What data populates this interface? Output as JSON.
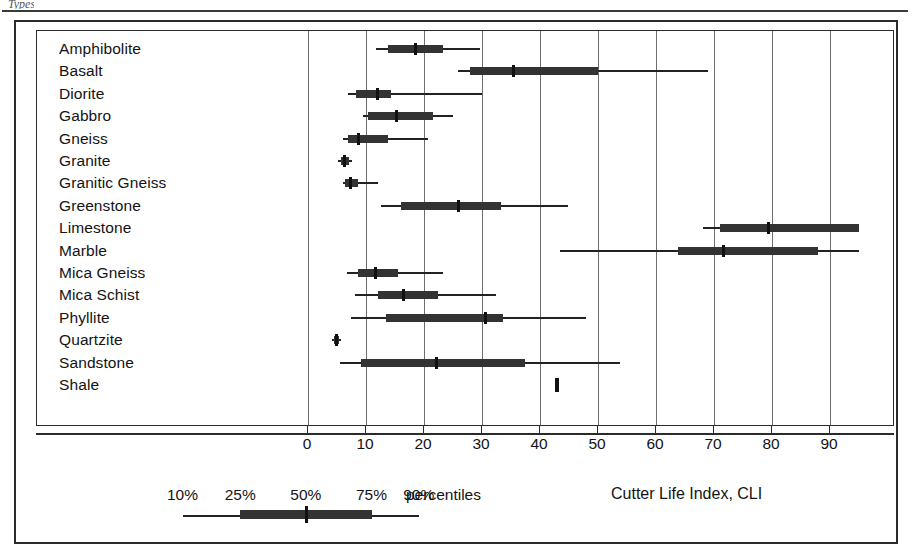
{
  "figure": {
    "top_fragment": "Types",
    "axis_title": "Cutter Life Index, CLI",
    "percentiles_word": "percentiles"
  },
  "chart_data": {
    "type": "boxplot",
    "title": "",
    "xlabel": "Cutter Life Index, CLI",
    "ylabel": "",
    "xlim": [
      0,
      95
    ],
    "xticks": [
      0,
      10,
      20,
      30,
      40,
      50,
      60,
      70,
      80,
      90
    ],
    "grid": true,
    "legend_position": "bottom-left",
    "legend_labels": [
      "10%",
      "25%",
      "50%",
      "75%",
      "90%"
    ],
    "box_definition": "whiskers = 10th and 90th percentiles, box = 25th to 75th percentiles, tick = 50th percentile (median)",
    "categories": [
      "Amphibolite",
      "Basalt",
      "Diorite",
      "Gabbro",
      "Gneiss",
      "Granite",
      "Granitic Gneiss",
      "Greenstone",
      "Limestone",
      "Marble",
      "Mica Gneiss",
      "Mica Schist",
      "Phyllite",
      "Quartzite",
      "Sandstone",
      "Shale"
    ],
    "series": [
      {
        "name": "Amphibolite",
        "p10": 11.7,
        "p25": 13.8,
        "p50": 18.4,
        "p75": 23.2,
        "p90": 29.7
      },
      {
        "name": "Basalt",
        "p10": 25.8,
        "p25": 27.9,
        "p50": 35.3,
        "p75": 50.0,
        "p90": 68.9
      },
      {
        "name": "Diorite",
        "p10": 6.9,
        "p25": 8.3,
        "p50": 11.9,
        "p75": 14.3,
        "p90": 30.0
      },
      {
        "name": "Gabbro",
        "p10": 9.5,
        "p25": 10.3,
        "p50": 15.1,
        "p75": 21.6,
        "p90": 25.0
      },
      {
        "name": "Gneiss",
        "p10": 6.0,
        "p25": 6.9,
        "p50": 8.6,
        "p75": 13.8,
        "p90": 20.7
      },
      {
        "name": "Granite",
        "p10": 5.2,
        "p25": 5.7,
        "p50": 6.2,
        "p75": 7.1,
        "p90": 7.6
      },
      {
        "name": "Granitic Gneiss",
        "p10": 6.0,
        "p25": 6.4,
        "p50": 7.2,
        "p75": 8.6,
        "p90": 12.1
      },
      {
        "name": "Greenstone",
        "p10": 12.6,
        "p25": 16.0,
        "p50": 25.9,
        "p75": 33.3,
        "p90": 44.8
      },
      {
        "name": "Limestone",
        "p10": 68.1,
        "p25": 71.0,
        "p50": 79.3,
        "p75": 95.0,
        "p90": 95.0
      },
      {
        "name": "Marble",
        "p10": 43.4,
        "p25": 63.8,
        "p50": 71.6,
        "p75": 87.9,
        "p90": 95.0
      },
      {
        "name": "Mica Gneiss",
        "p10": 6.7,
        "p25": 8.6,
        "p50": 11.6,
        "p75": 15.5,
        "p90": 23.3
      },
      {
        "name": "Mica Schist",
        "p10": 8.1,
        "p25": 12.1,
        "p50": 16.4,
        "p75": 22.4,
        "p90": 32.4
      },
      {
        "name": "Phyllite",
        "p10": 7.4,
        "p25": 13.4,
        "p50": 30.5,
        "p75": 33.6,
        "p90": 47.9
      },
      {
        "name": "Quartzite",
        "p10": 4.1,
        "p25": 4.5,
        "p50": 4.8,
        "p75": 5.3,
        "p90": 5.7
      },
      {
        "name": "Sandstone",
        "p10": 5.5,
        "p25": 9.1,
        "p50": 22.1,
        "p75": 37.4,
        "p90": 53.8
      },
      {
        "name": "Shale",
        "p10": 42.8,
        "p25": 42.8,
        "p50": 43.0,
        "p75": 43.2,
        "p90": 43.2
      }
    ],
    "legend_example": {
      "p10": 10,
      "p25": 21,
      "p50": 33.5,
      "p75": 46,
      "p90": 55
    }
  }
}
